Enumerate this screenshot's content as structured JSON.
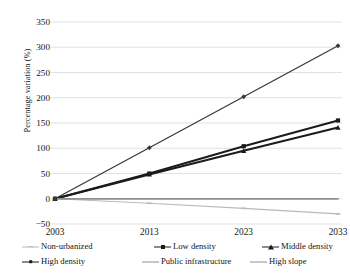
{
  "chart_data": {
    "type": "line",
    "title": "",
    "xlabel": "",
    "ylabel": "Percentage variation (%)",
    "x": [
      "2003",
      "2013",
      "2023",
      "2033"
    ],
    "categories": [
      "2003",
      "2013",
      "2023",
      "2033"
    ],
    "ylim": [
      -50,
      350
    ],
    "ytick_values": [
      350,
      300,
      250,
      200,
      150,
      100,
      50,
      0,
      -50
    ],
    "ytick_labels": [
      "350",
      "300",
      "250",
      "200",
      "150",
      "100",
      "50",
      "0",
      "−50"
    ],
    "grid": true,
    "legend_position": "bottom",
    "series": [
      {
        "name": "Non-urbanized",
        "values": [
          0,
          -9,
          -19,
          -30
        ],
        "color": "#b9b9b9",
        "marker": "tick",
        "width": 1.1
      },
      {
        "name": "Low density",
        "values": [
          0,
          50,
          104,
          155
        ],
        "color": "#1b1b1b",
        "marker": "square",
        "width": 1.9
      },
      {
        "name": "Middle density",
        "values": [
          0,
          48,
          95,
          141
        ],
        "color": "#1b1b1b",
        "marker": "triangle",
        "width": 1.9
      },
      {
        "name": "High density",
        "values": [
          0,
          101,
          202,
          303
        ],
        "color": "#3a3a3a",
        "marker": "diamond",
        "width": 1.3
      },
      {
        "name": "Public infrastructure",
        "values": [
          0,
          0,
          0,
          0
        ],
        "color": "#8f8f8f",
        "marker": "none",
        "width": 1.3
      },
      {
        "name": "High slope",
        "values": [
          0,
          0,
          0,
          0
        ],
        "color": "#8f8f8f",
        "marker": "none",
        "width": 1.3
      }
    ]
  },
  "axes": {
    "y_title": "Percentage variation (%)",
    "y_ticks": [
      "350",
      "300",
      "250",
      "200",
      "150",
      "100",
      "50",
      "0",
      "−50"
    ],
    "x_ticks": [
      "2003",
      "2013",
      "2023",
      "2033"
    ]
  },
  "legend": {
    "row1": [
      {
        "label": "Non-urbanized",
        "marker": "tick",
        "color": "#b9b9b9"
      },
      {
        "label": "Low density",
        "marker": "square",
        "color": "#1b1b1b"
      },
      {
        "label": "Middle density",
        "marker": "triangle",
        "color": "#1b1b1b"
      }
    ],
    "row2": [
      {
        "label": "High density",
        "marker": "diamond",
        "color": "#1b1b1b"
      },
      {
        "label": "Public infrastructure",
        "marker": "none",
        "color": "#8f8f8f"
      },
      {
        "label": "High slope",
        "marker": "none",
        "color": "#8f8f8f"
      }
    ]
  },
  "colors": {
    "grid": "#d9d9d9",
    "background": "#ffffff",
    "text": "#161616",
    "series_dark": "#1b1b1b",
    "series_gray": "#8f8f8f",
    "series_light": "#b9b9b9"
  }
}
